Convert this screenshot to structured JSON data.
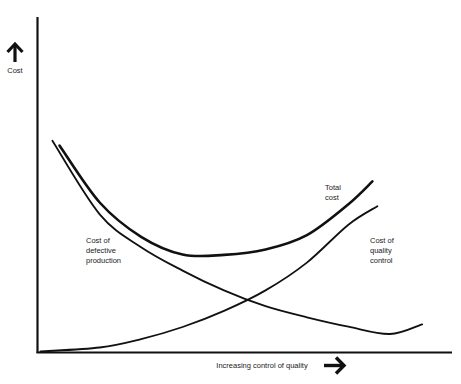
{
  "chart_data": {
    "type": "line",
    "title": "",
    "xlabel": "Increasing control of quality",
    "ylabel": "Cost",
    "xlim": [
      0,
      10
    ],
    "ylim": [
      0,
      10
    ],
    "grid": false,
    "legend": "none",
    "axis_arrows": {
      "x": "right-arrow-icon",
      "y": "up-arrow-icon"
    },
    "series": [
      {
        "name": "Total cost",
        "label_lines": [
          "Total",
          "cost"
        ],
        "stroke": "#111111",
        "emphasis": "bold",
        "x": [
          0.53,
          1.5,
          2.5,
          3.5,
          4.5,
          5.5,
          6.5,
          7.5,
          8.08
        ],
        "y": [
          6.17,
          4.47,
          3.45,
          2.92,
          2.91,
          3.07,
          3.5,
          4.42,
          5.1
        ]
      },
      {
        "name": "Cost of defective production",
        "label_lines": [
          "Cost of",
          "defective",
          "production"
        ],
        "stroke": "#111111",
        "emphasis": "normal",
        "x": [
          0.36,
          1.5,
          2.5,
          3.5,
          4.5,
          5.5,
          6.5,
          7.5,
          8.5,
          9.28
        ],
        "y": [
          6.31,
          4.12,
          3.14,
          2.44,
          1.85,
          1.38,
          1.05,
          0.77,
          0.55,
          0.84
        ]
      },
      {
        "name": "Cost of quality control",
        "label_lines": [
          "Cost of",
          "quality",
          "control"
        ],
        "stroke": "#111111",
        "emphasis": "normal",
        "x": [
          0.07,
          1.5,
          2.5,
          3.5,
          4.5,
          5.5,
          6.5,
          7.5,
          8.2
        ],
        "y": [
          0.03,
          0.15,
          0.4,
          0.76,
          1.24,
          1.85,
          2.68,
          3.81,
          4.36
        ]
      }
    ]
  }
}
